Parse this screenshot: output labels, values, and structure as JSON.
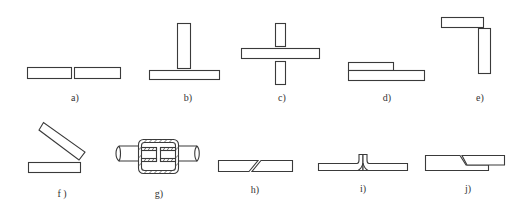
{
  "figure": {
    "type": "joint-types-diagram",
    "stroke_color": "#3a3a3a",
    "background": "#ffffff",
    "panels": [
      {
        "id": "a",
        "label": "a)",
        "description": "butt joint"
      },
      {
        "id": "b",
        "label": "b)",
        "description": "T joint"
      },
      {
        "id": "c",
        "label": "c)",
        "description": "cross joint"
      },
      {
        "id": "d",
        "label": "d)",
        "description": "lap joint"
      },
      {
        "id": "e",
        "label": "e)",
        "description": "corner joint"
      },
      {
        "id": "f",
        "label": "f )",
        "description": "angled joint"
      },
      {
        "id": "g",
        "label": "g)",
        "description": "sleeve coupling of rods"
      },
      {
        "id": "h",
        "label": "h)",
        "description": "scarf joint"
      },
      {
        "id": "i",
        "label": "i)",
        "description": "flanged edge joint"
      },
      {
        "id": "j",
        "label": "j)",
        "description": "locked lap joint"
      }
    ]
  }
}
